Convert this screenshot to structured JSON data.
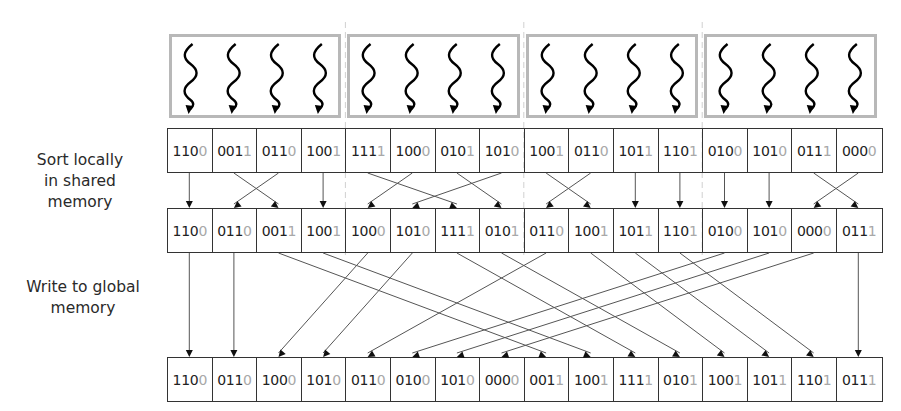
{
  "labels": {
    "sort_locally": [
      "Sort locally",
      "in shared",
      "memory"
    ],
    "write_global": [
      "Write to global",
      "memory"
    ]
  },
  "thread_blocks": [
    {
      "threads": 4
    },
    {
      "threads": 4
    },
    {
      "threads": 4
    },
    {
      "threads": 4
    }
  ],
  "rows": {
    "input": [
      [
        "110",
        "0"
      ],
      [
        "001",
        "1"
      ],
      [
        "011",
        "0"
      ],
      [
        "100",
        "1"
      ],
      [
        "111",
        "1"
      ],
      [
        "100",
        "0"
      ],
      [
        "010",
        "1"
      ],
      [
        "101",
        "0"
      ],
      [
        "100",
        "1"
      ],
      [
        "011",
        "0"
      ],
      [
        "101",
        "1"
      ],
      [
        "110",
        "1"
      ],
      [
        "010",
        "0"
      ],
      [
        "101",
        "0"
      ],
      [
        "011",
        "1"
      ],
      [
        "000",
        "0"
      ]
    ],
    "locally_sorted": [
      [
        "110",
        "0"
      ],
      [
        "011",
        "0"
      ],
      [
        "001",
        "1"
      ],
      [
        "100",
        "1"
      ],
      [
        "100",
        "0"
      ],
      [
        "101",
        "0"
      ],
      [
        "111",
        "1"
      ],
      [
        "010",
        "1"
      ],
      [
        "011",
        "0"
      ],
      [
        "100",
        "1"
      ],
      [
        "101",
        "1"
      ],
      [
        "110",
        "1"
      ],
      [
        "010",
        "0"
      ],
      [
        "101",
        "0"
      ],
      [
        "000",
        "0"
      ],
      [
        "011",
        "1"
      ]
    ],
    "global_output": [
      [
        "110",
        "0"
      ],
      [
        "011",
        "0"
      ],
      [
        "100",
        "0"
      ],
      [
        "101",
        "0"
      ],
      [
        "011",
        "0"
      ],
      [
        "010",
        "0"
      ],
      [
        "101",
        "0"
      ],
      [
        "000",
        "0"
      ],
      [
        "001",
        "1"
      ],
      [
        "100",
        "1"
      ],
      [
        "111",
        "1"
      ],
      [
        "010",
        "1"
      ],
      [
        "100",
        "1"
      ],
      [
        "101",
        "1"
      ],
      [
        "110",
        "1"
      ],
      [
        "011",
        "1"
      ]
    ]
  },
  "mappings": {
    "input_to_local": [
      0,
      2,
      1,
      3,
      6,
      4,
      7,
      5,
      9,
      8,
      10,
      11,
      12,
      13,
      15,
      14
    ],
    "local_to_global": [
      0,
      1,
      8,
      9,
      2,
      3,
      10,
      11,
      4,
      12,
      13,
      14,
      5,
      6,
      7,
      15
    ]
  },
  "colors": {
    "cell_border": "#333333",
    "lsb_digit": "#a8a8a8",
    "block_border": "#b8b8b8",
    "arrow": "#555555",
    "divider": "#d0d0d0"
  }
}
